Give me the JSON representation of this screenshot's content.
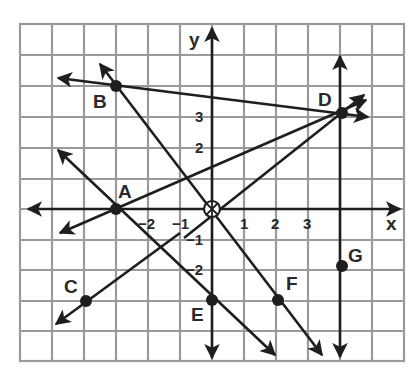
{
  "diagram": {
    "type": "coordinate-plane",
    "grid": {
      "x_min": -6,
      "x_max": 6,
      "y_min": -5,
      "y_max": 6
    },
    "axes": {
      "x_label": "x",
      "y_label": "y"
    },
    "x_tick_labels": [
      {
        "value": -2,
        "text": "−2"
      },
      {
        "value": -1,
        "text": "−1"
      },
      {
        "value": 1,
        "text": "1"
      },
      {
        "value": 2,
        "text": "2"
      },
      {
        "value": 3,
        "text": "3"
      }
    ],
    "y_tick_labels": [
      {
        "value": 3,
        "text": "3"
      },
      {
        "value": 2,
        "text": "2"
      },
      {
        "value": -1,
        "text": "−1"
      },
      {
        "value": -2,
        "text": "−2"
      }
    ],
    "origin_marker": "circled-cross",
    "points": [
      {
        "name": "A",
        "x": -3,
        "y": 0
      },
      {
        "name": "B",
        "x": -3,
        "y": 4
      },
      {
        "name": "C",
        "x": -4,
        "y": -3
      },
      {
        "name": "D",
        "x": 4,
        "y": 3
      },
      {
        "name": "E",
        "x": 0,
        "y": -3
      },
      {
        "name": "F",
        "x": 2,
        "y": -3
      },
      {
        "name": "G",
        "x": 4,
        "y": -2
      }
    ],
    "lines": [
      {
        "id": "x-axis",
        "description": "horizontal axis, arrows both ends"
      },
      {
        "id": "y-axis",
        "description": "vertical axis, arrows both ends"
      },
      {
        "id": "line-BD",
        "through": [
          "B",
          "D"
        ]
      },
      {
        "id": "line-AD",
        "through": [
          "A",
          "D"
        ]
      },
      {
        "id": "line-OD",
        "through": [
          "O",
          "D"
        ]
      },
      {
        "id": "line-BF",
        "through": [
          "B",
          "F"
        ]
      },
      {
        "id": "line-AE",
        "through": [
          "A",
          "E"
        ]
      },
      {
        "id": "line-C",
        "through": [
          "C"
        ],
        "direction": "up-right"
      },
      {
        "id": "line-DG",
        "through": [
          "D",
          "G"
        ],
        "vertical": true
      }
    ]
  }
}
